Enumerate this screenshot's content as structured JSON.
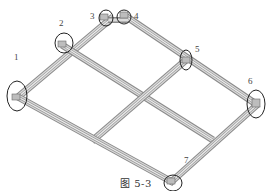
{
  "figure": {
    "caption": "图 5-3",
    "type": "isometric frame assembly diagram",
    "colors": {
      "beam_light": "#e6e6e6",
      "beam_mid": "#b3b3b3",
      "beam_dark": "#7a7a7a",
      "circle": "#222222",
      "label": "#444444"
    }
  },
  "callouts": [
    {
      "id": "1",
      "label": "1"
    },
    {
      "id": "2",
      "label": "2"
    },
    {
      "id": "3",
      "label": "3"
    },
    {
      "id": "4",
      "label": "4"
    },
    {
      "id": "5",
      "label": "5"
    },
    {
      "id": "6",
      "label": "6"
    },
    {
      "id": "7",
      "label": "7"
    }
  ]
}
